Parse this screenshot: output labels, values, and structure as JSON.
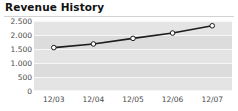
{
  "widget": {
    "title": "Revenue History"
  },
  "chart_data": {
    "type": "line",
    "title": "Revenue History",
    "xlabel": "",
    "ylabel": "",
    "categories": [
      "12/03",
      "12/04",
      "12/05",
      "12/06",
      "12/07"
    ],
    "values": [
      1550,
      1680,
      1880,
      2070,
      2330
    ],
    "series": [
      {
        "name": "Revenue",
        "values": [
          1550,
          1680,
          1880,
          2070,
          2330
        ]
      }
    ],
    "ylim": [
      0,
      2500
    ],
    "yticks": [
      0,
      500,
      1000,
      1500,
      2000,
      2500
    ],
    "ytick_labels": [
      "0",
      "500",
      "1.000",
      "1.500",
      "2.000",
      "2.500"
    ],
    "xtick_labels": [
      "12/03",
      "12/04",
      "12/05",
      "12/06",
      "12/07"
    ],
    "grid": true,
    "legend": "none",
    "line_color": "#1c1c1c",
    "marker_fill": "#ffffff",
    "marker_edge": "#1c1c1c",
    "plot_background": "#e4e4e4",
    "band_color": "#dcdcdc",
    "gridline_color": "#f7f7f7",
    "title_color": "#111111",
    "tick_color": "#4a4a4a"
  }
}
